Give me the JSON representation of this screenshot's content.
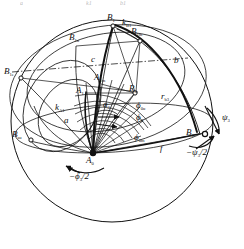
{
  "figure": {
    "background_color": "#ffffff",
    "ink_color": "#111111",
    "width": 244,
    "height": 249
  },
  "cut_top_labels": [
    {
      "id": "cut-a",
      "text": "a"
    },
    {
      "id": "cut-k1",
      "text": "k1"
    },
    {
      "id": "cut-b1",
      "text": "b1"
    }
  ],
  "points": [
    {
      "id": "B1",
      "label": "B",
      "sub": "1",
      "x": 113,
      "y": 22
    },
    {
      "id": "B1m",
      "label": "B",
      "sub": "1m",
      "x": 136,
      "y": 35
    },
    {
      "id": "B1u",
      "label": "B",
      "sub": "1u",
      "x": 76,
      "y": 40
    },
    {
      "id": "B1e",
      "label": "B",
      "sub": "1e",
      "x": 16,
      "y": 74
    },
    {
      "id": "B1su",
      "label": "B",
      "sub": "su",
      "x": 22,
      "y": 136
    },
    {
      "id": "B0",
      "label": "B",
      "sub": "0",
      "x": 195,
      "y": 133
    },
    {
      "id": "A1m",
      "label": "A",
      "sub": "1m",
      "x": 101,
      "y": 79
    },
    {
      "id": "A1",
      "label": "A",
      "sub": "1",
      "x": 83,
      "y": 92
    },
    {
      "id": "A0",
      "label": "A",
      "sub": "0",
      "x": 93,
      "y": 153
    },
    {
      "id": "R3",
      "label": "R",
      "sub": "3",
      "x": 135,
      "y": 93
    }
  ],
  "curve_labels": [
    {
      "id": "b",
      "label": "b",
      "sub": "",
      "x": 177,
      "y": 62
    },
    {
      "id": "c",
      "label": "c",
      "sub": "",
      "x": 94,
      "y": 61
    },
    {
      "id": "a",
      "label": "a",
      "sub": "",
      "x": 67,
      "y": 121
    },
    {
      "id": "f",
      "label": "f",
      "sub": "",
      "x": 163,
      "y": 148
    },
    {
      "id": "a3",
      "label": "a",
      "sub": "3",
      "x": 107,
      "y": 106
    },
    {
      "id": "kB1",
      "label": "k",
      "sub": "B1",
      "x": 126,
      "y": 24
    },
    {
      "id": "kA1",
      "label": "k",
      "sub": "A1",
      "x": 62,
      "y": 108
    },
    {
      "id": "rb3",
      "label": "r",
      "sub": "b3",
      "x": 166,
      "y": 98
    }
  ],
  "angle_labels": [
    {
      "id": "phi0u",
      "text": "ϕ",
      "sub": "0u",
      "x": 141,
      "y": 106
    },
    {
      "id": "phi0",
      "text": "ϕ",
      "sub": "0",
      "x": 141,
      "y": 118
    },
    {
      "id": "phi0m",
      "text": "ϕ",
      "sub": "0m",
      "x": 139,
      "y": 138
    },
    {
      "id": "psi3",
      "text": "ψ",
      "sub": "3",
      "x": 227,
      "y": 118
    },
    {
      "id": "psi3half",
      "text": "−ψ",
      "sub": "3",
      "suffix": "/2",
      "x": 196,
      "y": 152
    },
    {
      "id": "phi3half",
      "text": "−ϕ",
      "sub": "3",
      "suffix": "/2",
      "x": 78,
      "y": 176
    }
  ],
  "geometry": {
    "outer_circle": {
      "cx": 112,
      "cy": 121,
      "r": 101
    },
    "note": "Great circle boundary of the unit sphere projection"
  }
}
